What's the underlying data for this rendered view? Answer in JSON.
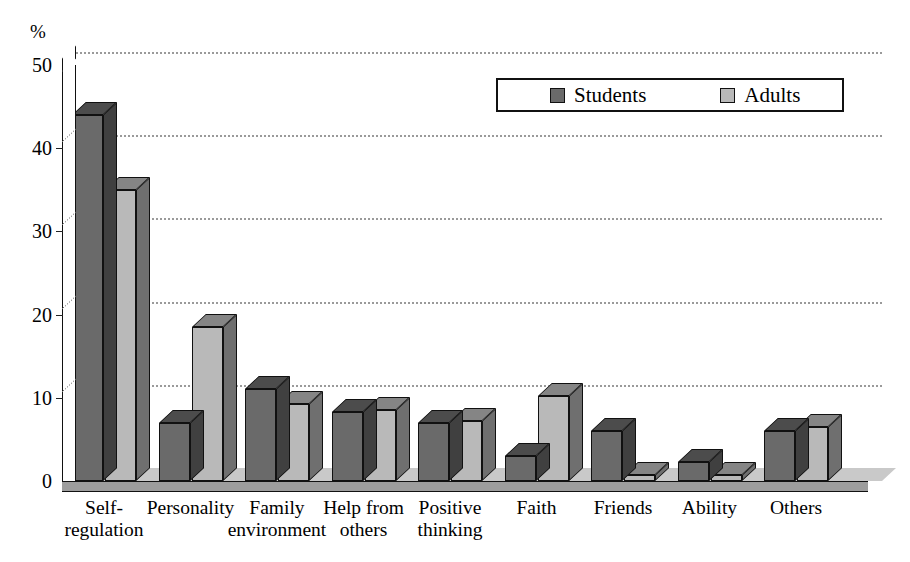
{
  "chart_data": {
    "type": "bar",
    "title": "",
    "subtitle": "",
    "xlabel": "",
    "ylabel": "%",
    "unit_label": "%",
    "ylim": [
      0,
      50
    ],
    "ytick_values": [
      0,
      10,
      20,
      30,
      40,
      50
    ],
    "ytick_labels": [
      "0",
      "10",
      "20",
      "30",
      "40",
      "50"
    ],
    "grid": true,
    "grid_orientation": "horizontal",
    "grid_style": "dotted",
    "legend_position": "top-right",
    "style": "3d-grouped-bar",
    "categories": [
      "Self-regulation",
      "Personality",
      "Family environment",
      "Help from others",
      "Positive thinking",
      "Faith",
      "Friends",
      "Ability",
      "Others"
    ],
    "category_lines": [
      [
        "Self-",
        "regulation"
      ],
      [
        "Personality",
        ""
      ],
      [
        "Family",
        "environment"
      ],
      [
        "Help from",
        "others"
      ],
      [
        "Positive",
        "thinking"
      ],
      [
        "Faith",
        ""
      ],
      [
        "Friends",
        ""
      ],
      [
        "Ability",
        ""
      ],
      [
        "Others",
        ""
      ]
    ],
    "series": [
      {
        "name": "Students",
        "color": "#6a6a6a",
        "values": [
          44,
          7,
          11,
          8.3,
          7,
          3,
          6,
          2.3,
          6
        ]
      },
      {
        "name": "Adults",
        "color": "#b9b9b9",
        "values": [
          35,
          18.5,
          9.3,
          8.5,
          7.2,
          10.2,
          0.7,
          0.7,
          6.5
        ]
      }
    ]
  },
  "legend": {
    "entries": [
      {
        "label": "Students",
        "color": "#6a6a6a"
      },
      {
        "label": "Adults",
        "color": "#b9b9b9"
      }
    ]
  },
  "colors": {
    "series_students": "#6a6a6a",
    "series_students_side": "#3d3d3d",
    "series_students_top": "#4a4a4a",
    "series_adults": "#b9b9b9",
    "series_adults_side": "#828282",
    "series_adults_top": "#9a9a9a",
    "gridline": "#9a9a9a",
    "axis": "#111111",
    "floor_front": "#9d9d9d",
    "floor_top": "#c9c9c9",
    "background": "#ffffff"
  }
}
